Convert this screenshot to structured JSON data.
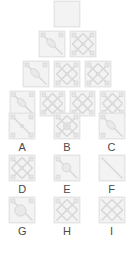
{
  "puzzle": {
    "type": "visual-matrix-reasoning",
    "background_color": "#ffffff",
    "tile_fill": "#f3f3f3",
    "tile_border": "#e2e2e2",
    "line_color": "#d8d8d8",
    "node_color": "#e6e6e6",
    "label_color": "#4a4a4a",
    "pyramid": {
      "row_count": 4,
      "rows": [
        {
          "index": 1,
          "tiles": [
            {
              "id": "p1-1",
              "glyph": "blank",
              "corners": "none",
              "center": "none"
            }
          ]
        },
        {
          "index": 2,
          "tiles": [
            {
              "id": "p2-1",
              "glyph": "diagonal-blob",
              "corners": "top",
              "center": "ellipse"
            },
            {
              "id": "p2-2",
              "glyph": "cross-x",
              "corners": "all",
              "center": "dot"
            }
          ]
        },
        {
          "index": 3,
          "tiles": [
            {
              "id": "p3-1",
              "glyph": "diagonal-blob",
              "corners": "top",
              "center": "ellipse"
            },
            {
              "id": "p3-2",
              "glyph": "cross-x",
              "corners": "all",
              "center": "dot"
            },
            {
              "id": "p3-3",
              "glyph": "cross-x",
              "corners": "all",
              "center": "dot"
            }
          ]
        },
        {
          "index": 4,
          "tiles": [
            {
              "id": "p4-1",
              "glyph": "diagonal-blob",
              "corners": "top",
              "center": "ellipse"
            },
            {
              "id": "p4-2",
              "glyph": "cross-x",
              "corners": "all",
              "center": "dot"
            },
            {
              "id": "p4-3",
              "glyph": "cross-x",
              "corners": "all",
              "center": "dot"
            },
            {
              "id": "p4-4",
              "glyph": "cross-x",
              "corners": "all",
              "center": "dot"
            }
          ]
        }
      ]
    },
    "options": [
      {
        "label": "A",
        "glyph": "diagonal-plain",
        "corners": "all",
        "center": "dot"
      },
      {
        "label": "B",
        "glyph": "cross-x",
        "corners": "all",
        "center": "ring"
      },
      {
        "label": "C",
        "glyph": "diagonal-blob",
        "corners": "left",
        "center": "ellipse"
      },
      {
        "label": "D",
        "glyph": "cross-x",
        "corners": "all",
        "center": "dot"
      },
      {
        "label": "E",
        "glyph": "diagonal-blob",
        "corners": "left",
        "center": "circle"
      },
      {
        "label": "F",
        "glyph": "diagonal-plain",
        "corners": "none",
        "center": "none"
      },
      {
        "label": "G",
        "glyph": "diagonal-blob",
        "corners": "top",
        "center": "circle-large"
      },
      {
        "label": "H",
        "glyph": "cross-x",
        "corners": "top",
        "center": "dot"
      },
      {
        "label": "I",
        "glyph": "cross-x",
        "corners": "none",
        "center": "none"
      }
    ]
  }
}
